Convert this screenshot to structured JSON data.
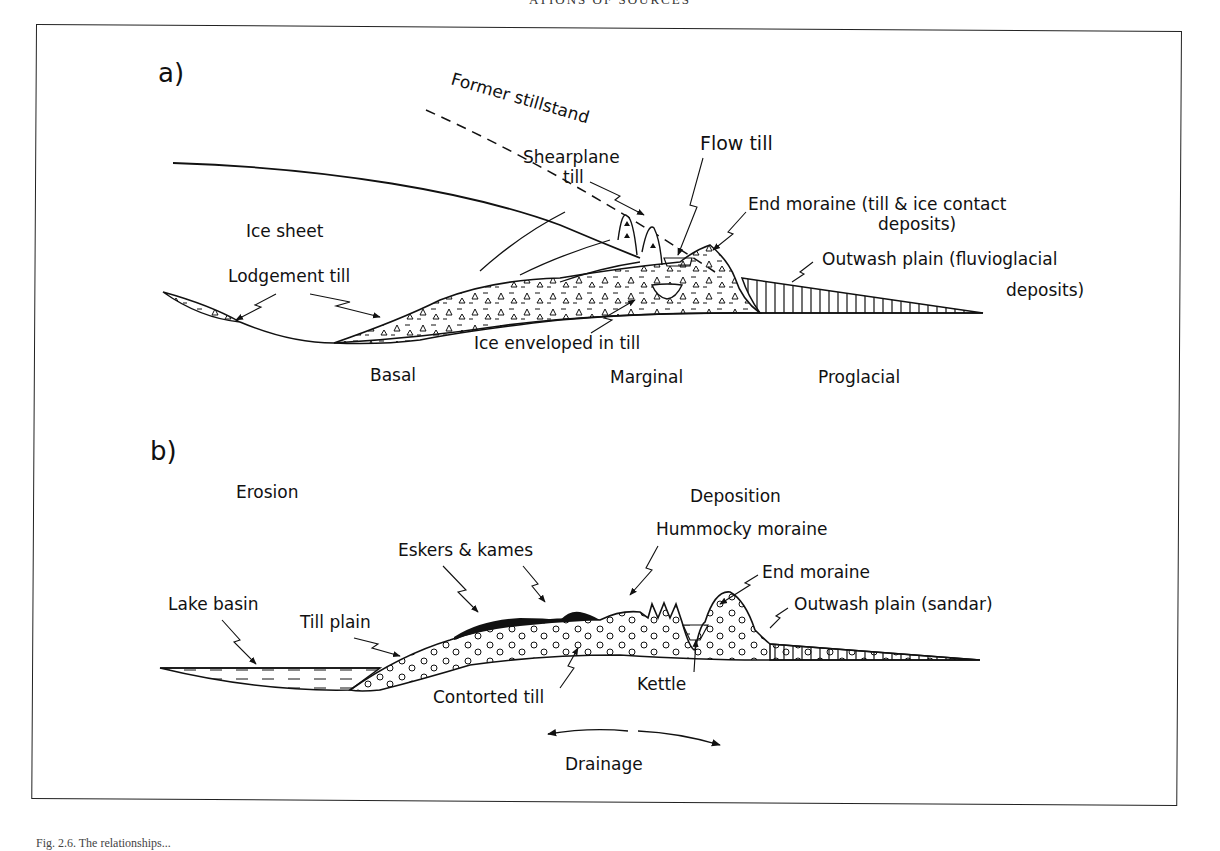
{
  "page": {
    "running_head": "ATIONS OF SOURCES",
    "caption": "Fig. 2.6. The relationships..."
  },
  "panel_a": {
    "label": "a)",
    "labels": {
      "former_stillstand": "Former stillstand",
      "shearplane_till_1": "Shearplane",
      "shearplane_till_2": "till",
      "flow_till": "Flow till",
      "end_moraine_1": "End moraine (till & ice contact",
      "end_moraine_2": "deposits)",
      "ice_sheet": "Ice sheet",
      "outwash_1": "Outwash plain (fluvioglacial",
      "outwash_2": "deposits)",
      "lodgement_till": "Lodgement till",
      "ice_enveloped": "Ice enveloped in till"
    },
    "zones": [
      "Basal",
      "Marginal",
      "Proglacial"
    ]
  },
  "panel_b": {
    "label": "b)",
    "labels": {
      "erosion": "Erosion",
      "deposition": "Deposition",
      "hummocky_moraine": "Hummocky moraine",
      "eskers_kames": "Eskers & kames",
      "end_moraine": "End moraine",
      "lake_basin": "Lake basin",
      "till_plain": "Till plain",
      "outwash": "Outwash plain (sandar)",
      "contorted_till": "Contorted till",
      "kettle": "Kettle",
      "drainage": "Drainage"
    }
  }
}
